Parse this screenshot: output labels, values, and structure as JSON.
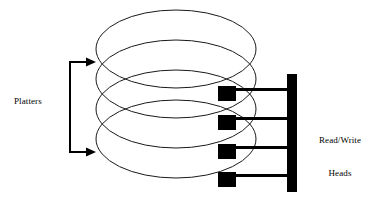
{
  "diagram": {
    "background_color": "#ffffff",
    "ink_color": "#000000",
    "platter_stroke_color": "#1a1a1a",
    "labels": {
      "platters": "Platters",
      "read_write_heads_line1": "Read/Write",
      "read_write_heads_line2": "Heads"
    },
    "platters": {
      "count": 4,
      "shape": "ellipse",
      "rx": 80,
      "ry": 39,
      "cx": 176,
      "cy_values": [
        49,
        79,
        109,
        139
      ],
      "fill": "none"
    },
    "head_assembly": {
      "arm_count": 4,
      "vertical_bar": {
        "x": 287,
        "y": 74,
        "width": 10,
        "height": 118
      },
      "arms": [
        {
          "block_x": 218,
          "block_y": 86,
          "block_w": 18,
          "block_h": 15,
          "arm_y": 88,
          "arm_h": 3,
          "arm_x2": 287
        },
        {
          "block_x": 218,
          "block_y": 115,
          "block_w": 18,
          "block_h": 15,
          "arm_y": 117,
          "arm_h": 3,
          "arm_x2": 287
        },
        {
          "block_x": 218,
          "block_y": 144,
          "block_w": 18,
          "block_h": 15,
          "arm_y": 146,
          "arm_h": 3,
          "arm_x2": 287
        },
        {
          "block_x": 218,
          "block_y": 172,
          "block_w": 18,
          "block_h": 15,
          "arm_y": 174,
          "arm_h": 3,
          "arm_x2": 287
        }
      ]
    },
    "platters_bracket": {
      "vertical_x": 70,
      "top_y": 62,
      "bottom_y": 152,
      "arrow_tip_x": 96
    }
  }
}
